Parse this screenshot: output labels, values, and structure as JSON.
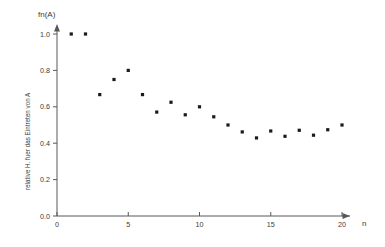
{
  "chart_data": {
    "type": "scatter",
    "title": "",
    "subtitle": "",
    "xlabel": "n",
    "ylabel": "fn(A)",
    "ylabel_rotated": "relative H. fuer das Eintreten von A",
    "xlim": [
      0,
      20.6
    ],
    "ylim": [
      0,
      1.06
    ],
    "grid": false,
    "legend": false,
    "xticks": [
      0,
      5,
      10,
      15,
      20
    ],
    "xtick_labels": [
      "0",
      "5",
      "10",
      "15",
      "20"
    ],
    "yticks": [
      0.0,
      0.2,
      0.4,
      0.6,
      0.8,
      1.0
    ],
    "ytick_labels": [
      "0.0",
      "0.2",
      "0.4",
      "0.6",
      "0.8",
      "1.0"
    ],
    "marker": "square",
    "marker_color": "#1a1a1a",
    "axis_color": "#58585a",
    "background_color": "#ffffff",
    "x": [
      1,
      2,
      3,
      4,
      5,
      6,
      7,
      8,
      9,
      10,
      11,
      12,
      13,
      14,
      15,
      16,
      17,
      18,
      19,
      20
    ],
    "values": [
      1.0,
      1.0,
      0.667,
      0.75,
      0.8,
      0.667,
      0.571,
      0.625,
      0.556,
      0.6,
      0.545,
      0.5,
      0.462,
      0.429,
      0.467,
      0.438,
      0.471,
      0.444,
      0.474,
      0.5
    ],
    "points": [
      {
        "n": 1,
        "fn": 1.0
      },
      {
        "n": 2,
        "fn": 1.0
      },
      {
        "n": 3,
        "fn": 0.667
      },
      {
        "n": 4,
        "fn": 0.75
      },
      {
        "n": 5,
        "fn": 0.8
      },
      {
        "n": 6,
        "fn": 0.667
      },
      {
        "n": 7,
        "fn": 0.571
      },
      {
        "n": 8,
        "fn": 0.625
      },
      {
        "n": 9,
        "fn": 0.556
      },
      {
        "n": 10,
        "fn": 0.6
      },
      {
        "n": 11,
        "fn": 0.545
      },
      {
        "n": 12,
        "fn": 0.5
      },
      {
        "n": 13,
        "fn": 0.462
      },
      {
        "n": 14,
        "fn": 0.429
      },
      {
        "n": 15,
        "fn": 0.467
      },
      {
        "n": 16,
        "fn": 0.438
      },
      {
        "n": 17,
        "fn": 0.471
      },
      {
        "n": 18,
        "fn": 0.444
      },
      {
        "n": 19,
        "fn": 0.474
      },
      {
        "n": 20,
        "fn": 0.5
      }
    ]
  }
}
